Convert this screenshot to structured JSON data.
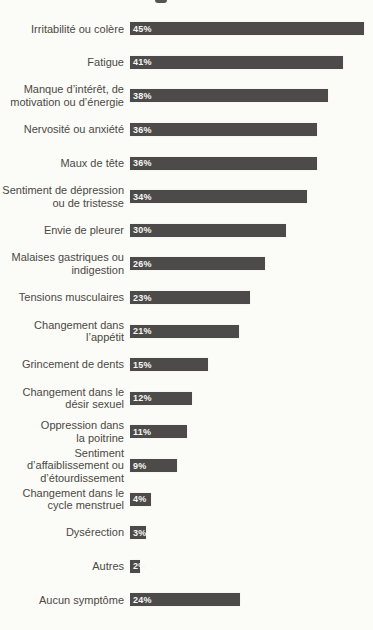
{
  "page": {
    "background_color": "#fbfbf8",
    "note": "scanned print page, title cropped off above"
  },
  "chart_data": {
    "type": "bar",
    "orientation": "horizontal",
    "title": "",
    "xlabel": "",
    "ylabel": "",
    "unit": "%",
    "xlim": [
      0,
      46
    ],
    "grid": false,
    "legend": "none",
    "axes_visible": false,
    "bar_color": "#4c4b49",
    "label_color": "#4b4943",
    "value_label_color": "#f6f6f3",
    "px_per_percent": 5.2,
    "categories": [
      "Irritabilité ou colère",
      "Fatigue",
      "Manque d’intérêt, de motivation ou d’énergie",
      "Nervosité ou anxiété",
      "Maux de tête",
      "Sentiment de dépression ou de tristesse",
      "Envie de pleurer",
      "Malaises gastriques ou indigestion",
      "Tensions musculaires",
      "Changement dans l’appétit",
      "Grincement de dents",
      "Changement dans le désir sexuel",
      "Oppression dans la poitrine",
      "Sentiment d’affaiblissement ou d’étourdissement",
      "Changement dans le cycle menstruel",
      "Dysérection",
      "Autres",
      "Aucun symptôme"
    ],
    "values": [
      45,
      41,
      38,
      36,
      36,
      34,
      30,
      26,
      23,
      21,
      15,
      12,
      11,
      9,
      4,
      3,
      2,
      24
    ],
    "items": [
      {
        "label_lines": [
          "Irritabilité ou colère"
        ],
        "value": 45,
        "value_label": "45%"
      },
      {
        "label_lines": [
          "Fatigue"
        ],
        "value": 41,
        "value_label": "41%"
      },
      {
        "label_lines": [
          "Manque d’intérêt, de",
          "motivation ou d’énergie"
        ],
        "value": 38,
        "value_label": "38%"
      },
      {
        "label_lines": [
          "Nervosité ou anxiété"
        ],
        "value": 36,
        "value_label": "36%"
      },
      {
        "label_lines": [
          "Maux de tête"
        ],
        "value": 36,
        "value_label": "36%"
      },
      {
        "label_lines": [
          "Sentiment de dépression",
          "ou de tristesse"
        ],
        "value": 34,
        "value_label": "34%"
      },
      {
        "label_lines": [
          "Envie de pleurer"
        ],
        "value": 30,
        "value_label": "30%"
      },
      {
        "label_lines": [
          "Malaises gastriques ou",
          "indigestion"
        ],
        "value": 26,
        "value_label": "26%"
      },
      {
        "label_lines": [
          "Tensions musculaires"
        ],
        "value": 23,
        "value_label": "23%"
      },
      {
        "label_lines": [
          "Changement dans",
          "l’appétit"
        ],
        "value": 21,
        "value_label": "21%"
      },
      {
        "label_lines": [
          "Grincement de dents"
        ],
        "value": 15,
        "value_label": "15%"
      },
      {
        "label_lines": [
          "Changement dans le",
          "désir sexuel"
        ],
        "value": 12,
        "value_label": "12%"
      },
      {
        "label_lines": [
          "Oppression dans",
          "la poitrine"
        ],
        "value": 11,
        "value_label": "11%"
      },
      {
        "label_lines": [
          "Sentiment",
          "d’affaiblissement ou",
          "d’étourdissement"
        ],
        "value": 9,
        "value_label": "9%"
      },
      {
        "label_lines": [
          "Changement dans le",
          "cycle menstruel"
        ],
        "value": 4,
        "value_label": "4%"
      },
      {
        "label_lines": [
          "Dysérection"
        ],
        "value": 3,
        "value_label": "3%"
      },
      {
        "label_lines": [
          "Autres"
        ],
        "value": 2,
        "value_label": "2%"
      },
      {
        "label_lines": [
          "Aucun symptôme"
        ],
        "value": 24,
        "value_label": "24%",
        "bar_px": 110
      }
    ]
  }
}
